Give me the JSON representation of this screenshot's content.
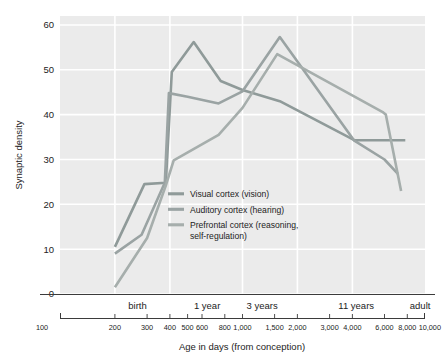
{
  "chart_data": {
    "type": "line",
    "title": "",
    "xlabel": "Age in days (from conception)",
    "ylabel": "Synaptic density",
    "xscale": "log",
    "xlim": [
      100,
      10000
    ],
    "ylim": [
      0,
      62
    ],
    "grid": true,
    "legend_position": "inside-center-left",
    "y_ticks": [
      "60",
      "50",
      "40",
      "30",
      "20",
      "10",
      "0"
    ],
    "y_tick_values": [
      60,
      50,
      40,
      30,
      20,
      10,
      0
    ],
    "x_ticks": [
      "100",
      "200",
      "300",
      "400",
      "500",
      "600",
      "800",
      "1,000",
      "1,500",
      "2,000",
      "3,000",
      "4,000",
      "6,000",
      "8,000",
      "10,000"
    ],
    "x_tick_values": [
      100,
      200,
      300,
      400,
      500,
      600,
      800,
      1000,
      1500,
      2000,
      3000,
      4000,
      6000,
      8000,
      10000
    ],
    "x_band_labels": [
      {
        "label": "birth",
        "at": 266
      },
      {
        "label": "1 year",
        "at": 640
      },
      {
        "label": "3 years",
        "at": 1280
      },
      {
        "label": "11 years",
        "at": 4200
      },
      {
        "label": "adult",
        "at": 9400
      }
    ],
    "series": [
      {
        "name": "Visual cortex (vision)",
        "color": "#8f9a99",
        "points": [
          [
            200,
            10.5
          ],
          [
            290,
            24.5
          ],
          [
            380,
            24.8
          ],
          [
            410,
            49.5
          ],
          [
            540,
            56.2
          ],
          [
            760,
            47.5
          ],
          [
            1000,
            45.5
          ],
          [
            1600,
            43.0
          ],
          [
            4100,
            34.3
          ],
          [
            7800,
            34.3
          ]
        ]
      },
      {
        "name": "Auditory cortex (hearing)",
        "color": "#9aa3a3",
        "points": [
          [
            200,
            9.0
          ],
          [
            280,
            13.2
          ],
          [
            375,
            24.8
          ],
          [
            395,
            44.8
          ],
          [
            500,
            44.0
          ],
          [
            740,
            42.5
          ],
          [
            1000,
            45.2
          ],
          [
            1600,
            57.3
          ],
          [
            4100,
            34.2
          ],
          [
            6000,
            30.0
          ],
          [
            7100,
            26.8
          ]
        ]
      },
      {
        "name": "Prefrontal cortex (reasoning, self-regulation)",
        "color": "#a6aeac",
        "points": [
          [
            200,
            1.5
          ],
          [
            300,
            12.5
          ],
          [
            380,
            24.2
          ],
          [
            420,
            29.8
          ],
          [
            740,
            35.5
          ],
          [
            1000,
            41.5
          ],
          [
            1550,
            53.5
          ],
          [
            5900,
            40.5
          ],
          [
            6100,
            40.0
          ],
          [
            7400,
            23.0
          ]
        ]
      }
    ],
    "legend": [
      {
        "label": "Visual cortex (vision)",
        "color": "#8f9a99"
      },
      {
        "label": "Auditory cortex (hearing)",
        "color": "#9aa3a3"
      },
      {
        "label": "Prefrontal cortex (reasoning,",
        "label2": "self-regulation)",
        "color": "#a6aeac"
      }
    ],
    "style": {
      "plot_bg": "#ebebeb",
      "gridline_color": "#ffffff",
      "axis_color": "#3b3b3b",
      "text_color": "#232323"
    }
  }
}
